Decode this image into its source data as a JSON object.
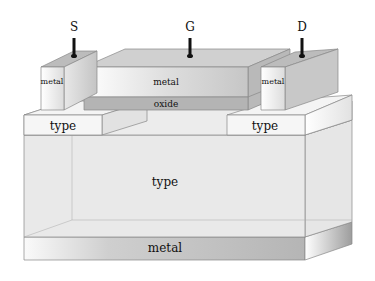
{
  "diagram": {
    "type": "mosfet-cross-section-3d",
    "terminals": {
      "source": "S",
      "gate": "G",
      "drain": "D"
    },
    "layers": {
      "gate_metal": "metal",
      "gate_oxide": "oxide",
      "source_metal": "metal",
      "drain_metal": "metal",
      "source_region": "type",
      "drain_region": "type",
      "substrate": "type",
      "bottom_contact": "metal"
    },
    "colors": {
      "background": "#ffffff",
      "light_face": "#f0f0f0",
      "mid_face": "#d6d6d6",
      "dark_face": "#bdbdbd",
      "oxide": "#b8b8b8",
      "lead": "#111111"
    }
  }
}
